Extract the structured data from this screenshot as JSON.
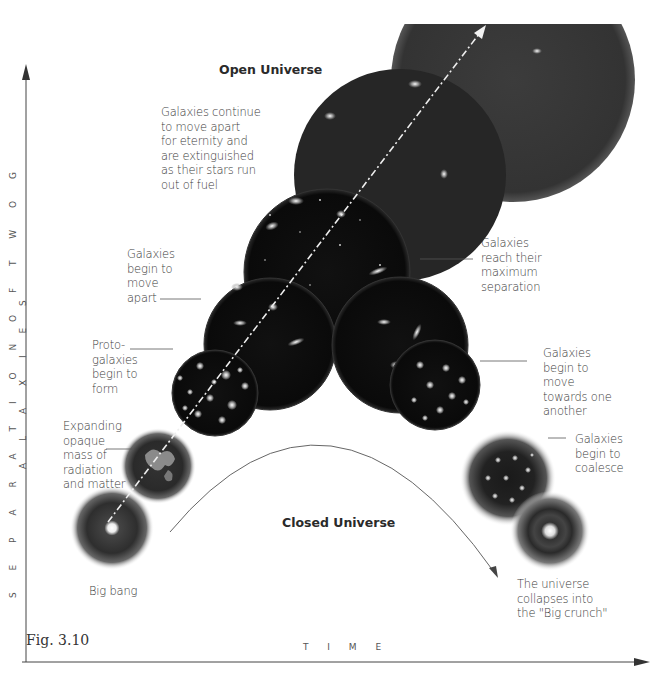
{
  "figure": {
    "caption": "Fig. 3.10",
    "x_axis_label": "T I M E",
    "y_axis_label": "S E P A R A T I O N   O F   T W O   G A L A X I E S",
    "colors": {
      "sphere_dark": "#0b0b0b",
      "sphere_gray": "#3a3a3a",
      "axis": "#444444",
      "arrow_dashed": "#e8e8e8",
      "background": "#ffffff"
    }
  },
  "titles": {
    "open_universe": "Open Universe",
    "closed_universe": "Closed Universe"
  },
  "annotations": {
    "continue_apart": "Galaxies continue\nto move apart\nfor eternity and\nare extinguished\nas their stars run\nout of fuel",
    "begin_move_apart": "Galaxies\nbegin to\nmove\napart",
    "protogalaxies": "Proto-\ngalaxies\nbegin to\nform",
    "expanding_opaque": "Expanding\nopaque\nmass of\nradiation\nand matter",
    "big_bang": "Big bang",
    "max_separation": "Galaxies\nreach their\nmaximum\nseparation",
    "move_towards": "Galaxies\nbegin to\nmove\ntowards one\nanother",
    "coalesce": "Galaxies\nbegin to\ncoalesce",
    "big_crunch": "The universe\ncollapses into\nthe \"Big crunch\""
  },
  "stages": [
    {
      "id": "big-bang",
      "branch": "both"
    },
    {
      "id": "expanding-opaque",
      "branch": "both"
    },
    {
      "id": "protogalaxies",
      "branch": "both"
    },
    {
      "id": "begin-move-apart",
      "branch": "both"
    },
    {
      "id": "max-separation",
      "branch": "closed"
    },
    {
      "id": "move-towards",
      "branch": "closed"
    },
    {
      "id": "coalesce",
      "branch": "closed"
    },
    {
      "id": "big-crunch",
      "branch": "closed"
    },
    {
      "id": "continue-apart",
      "branch": "open"
    }
  ]
}
